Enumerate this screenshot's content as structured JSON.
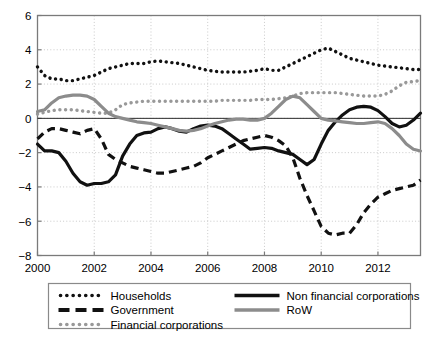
{
  "chart_data": {
    "type": "line",
    "title": "",
    "xlabel": "",
    "ylabel": "",
    "xlim": [
      2000,
      2013.5
    ],
    "ylim": [
      -8,
      6
    ],
    "yticks": [
      6,
      4,
      2,
      0,
      -2,
      -4,
      -6,
      -8
    ],
    "ytick_labels": [
      "6",
      "4",
      "2",
      "0",
      "-2",
      "-4",
      "-6",
      "-8"
    ],
    "xticks": [
      2000,
      2002,
      2004,
      2006,
      2008,
      2010,
      2012
    ],
    "xtick_labels": [
      "2000",
      "2002",
      "2004",
      "2006",
      "2008",
      "2010",
      "2012"
    ],
    "grid": true,
    "grid_style": "dotted",
    "zero_line": true,
    "legend_position": "below-plot",
    "x": [
      2000,
      2000.25,
      2000.5,
      2000.75,
      2001,
      2001.25,
      2001.5,
      2001.75,
      2002,
      2002.25,
      2002.5,
      2002.75,
      2003,
      2003.25,
      2003.5,
      2003.75,
      2004,
      2004.25,
      2004.5,
      2004.75,
      2005,
      2005.25,
      2005.5,
      2005.75,
      2006,
      2006.25,
      2006.5,
      2006.75,
      2007,
      2007.25,
      2007.5,
      2007.75,
      2008,
      2008.25,
      2008.5,
      2008.75,
      2009,
      2009.25,
      2009.5,
      2009.75,
      2010,
      2010.25,
      2010.5,
      2010.75,
      2011,
      2011.25,
      2011.5,
      2011.75,
      2012,
      2012.25,
      2012.5,
      2012.75,
      2013,
      2013.25,
      2013.5
    ],
    "series": [
      {
        "name": "Households",
        "style": "dotted",
        "color": "#111111",
        "values": [
          3.0,
          2.5,
          2.3,
          2.3,
          2.2,
          2.2,
          2.3,
          2.4,
          2.5,
          2.7,
          2.9,
          3.0,
          3.1,
          3.2,
          3.2,
          3.2,
          3.3,
          3.35,
          3.3,
          3.25,
          3.2,
          3.1,
          3.0,
          2.9,
          2.8,
          2.75,
          2.7,
          2.7,
          2.7,
          2.7,
          2.75,
          2.8,
          2.9,
          2.8,
          2.8,
          3.0,
          3.2,
          3.4,
          3.6,
          3.8,
          4.0,
          4.1,
          3.9,
          3.7,
          3.5,
          3.4,
          3.3,
          3.2,
          3.1,
          3.05,
          3.0,
          2.95,
          2.9,
          2.85,
          2.85
        ]
      },
      {
        "name": "Government",
        "style": "dashed",
        "color": "#111111",
        "values": [
          -1.2,
          -0.8,
          -0.6,
          -0.6,
          -0.7,
          -0.8,
          -0.9,
          -0.7,
          -0.6,
          -1.2,
          -2.1,
          -2.4,
          -2.6,
          -2.8,
          -2.9,
          -3.0,
          -3.1,
          -3.2,
          -3.2,
          -3.1,
          -3.0,
          -2.9,
          -2.8,
          -2.6,
          -2.3,
          -2.1,
          -1.9,
          -1.7,
          -1.5,
          -1.3,
          -1.2,
          -1.1,
          -1.0,
          -1.1,
          -1.3,
          -1.6,
          -2.3,
          -3.5,
          -4.5,
          -5.4,
          -6.3,
          -6.7,
          -6.8,
          -6.7,
          -6.7,
          -6.2,
          -5.5,
          -5.0,
          -4.6,
          -4.4,
          -4.2,
          -4.1,
          -4.0,
          -3.9,
          -3.6
        ]
      },
      {
        "name": "Financial corporations",
        "style": "dotted",
        "color": "#999999",
        "values": [
          0.25,
          0.35,
          0.45,
          0.5,
          0.5,
          0.5,
          0.45,
          0.4,
          0.35,
          0.3,
          0.3,
          0.5,
          0.8,
          0.9,
          0.95,
          1.0,
          1.0,
          1.0,
          1.0,
          1.0,
          1.0,
          1.0,
          1.0,
          1.0,
          1.0,
          1.0,
          1.05,
          1.05,
          1.05,
          1.05,
          1.05,
          1.1,
          1.1,
          1.1,
          1.15,
          1.2,
          1.3,
          1.45,
          1.5,
          1.5,
          1.5,
          1.5,
          1.5,
          1.45,
          1.4,
          1.35,
          1.3,
          1.3,
          1.3,
          1.4,
          1.6,
          1.9,
          2.1,
          2.15,
          2.2
        ]
      },
      {
        "name": "Non financial corporations",
        "style": "solid",
        "color": "#111111",
        "values": [
          -1.5,
          -1.9,
          -1.9,
          -2.0,
          -2.5,
          -3.2,
          -3.7,
          -3.9,
          -3.8,
          -3.8,
          -3.7,
          -3.3,
          -2.2,
          -1.5,
          -1.0,
          -0.85,
          -0.8,
          -0.6,
          -0.5,
          -0.6,
          -0.75,
          -0.8,
          -0.6,
          -0.45,
          -0.4,
          -0.45,
          -0.6,
          -0.9,
          -1.2,
          -1.5,
          -1.8,
          -1.75,
          -1.7,
          -1.75,
          -1.9,
          -2.0,
          -2.1,
          -2.4,
          -2.7,
          -2.4,
          -1.5,
          -0.7,
          -0.2,
          0.2,
          0.5,
          0.65,
          0.7,
          0.65,
          0.45,
          0.1,
          -0.3,
          -0.5,
          -0.4,
          -0.1,
          0.3
        ]
      },
      {
        "name": "RoW",
        "style": "solid",
        "color": "#8c8c8c",
        "values": [
          0.4,
          0.5,
          0.9,
          1.2,
          1.3,
          1.35,
          1.35,
          1.3,
          1.1,
          0.7,
          0.3,
          0.1,
          0.0,
          -0.1,
          -0.2,
          -0.25,
          -0.3,
          -0.4,
          -0.5,
          -0.6,
          -0.7,
          -0.75,
          -0.7,
          -0.6,
          -0.45,
          -0.3,
          -0.2,
          -0.1,
          -0.05,
          -0.05,
          -0.1,
          -0.1,
          0.0,
          0.3,
          0.7,
          1.1,
          1.3,
          1.2,
          0.8,
          0.4,
          0.0,
          -0.1,
          -0.15,
          -0.2,
          -0.25,
          -0.3,
          -0.3,
          -0.25,
          -0.2,
          -0.3,
          -0.6,
          -1.0,
          -1.5,
          -1.8,
          -1.9
        ]
      }
    ]
  },
  "legend": {
    "items": [
      {
        "label": "Households",
        "style": "dotted",
        "color": "#111111"
      },
      {
        "label": "Government",
        "style": "dashed",
        "color": "#111111"
      },
      {
        "label": "Financial corporations",
        "style": "dotted",
        "color": "#999999"
      },
      {
        "label": "Non financial corporations",
        "style": "solid",
        "color": "#111111"
      },
      {
        "label": "RoW",
        "style": "solid",
        "color": "#8c8c8c"
      }
    ]
  },
  "colors": {
    "black": "#111111",
    "gray": "#8c8c8c",
    "light_gray": "#999999",
    "axis": "#7a7a7a",
    "grid": "#c9c9c9",
    "background": "#ffffff"
  }
}
